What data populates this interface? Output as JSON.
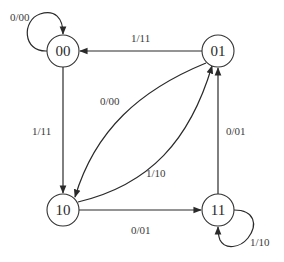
{
  "diagram": {
    "type": "state-transition-diagram",
    "states": [
      {
        "id": "s00",
        "label": "00",
        "cx": 63,
        "cy": 51
      },
      {
        "id": "s01",
        "label": "01",
        "cx": 218,
        "cy": 51
      },
      {
        "id": "s10",
        "label": "10",
        "cx": 63,
        "cy": 210
      },
      {
        "id": "s11",
        "label": "11",
        "cx": 218,
        "cy": 210
      }
    ],
    "transitions": [
      {
        "from": "00",
        "to": "00",
        "label": "0/00"
      },
      {
        "from": "01",
        "to": "00",
        "label": "1/11"
      },
      {
        "from": "00",
        "to": "10",
        "label": "1/11"
      },
      {
        "from": "01",
        "to": "10",
        "label": "0/00"
      },
      {
        "from": "10",
        "to": "01",
        "label": "1/10"
      },
      {
        "from": "11",
        "to": "01",
        "label": "0/01"
      },
      {
        "from": "10",
        "to": "11",
        "label": "0/01"
      },
      {
        "from": "11",
        "to": "11",
        "label": "1/10"
      }
    ],
    "labels": {
      "self_00": "0/00",
      "e01_00": "1/11",
      "e00_10": "1/11",
      "e01_10": "0/00",
      "e10_01": "1/10",
      "e11_01": "0/01",
      "e10_11": "0/01",
      "self_11": "1/10"
    },
    "state_labels": {
      "s00": "00",
      "s01": "01",
      "s10": "10",
      "s11": "11"
    }
  }
}
